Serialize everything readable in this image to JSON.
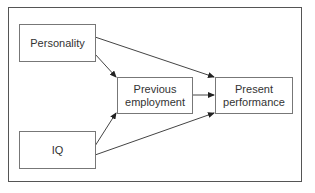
{
  "diagram": {
    "type": "path-diagram",
    "nodes": [
      {
        "id": "personality",
        "label": "Personality"
      },
      {
        "id": "iq",
        "label": "IQ"
      },
      {
        "id": "previous",
        "label": "Previous employment",
        "lines": [
          "Previous",
          "employment"
        ]
      },
      {
        "id": "present",
        "label": "Present performance",
        "lines": [
          "Present",
          "performance"
        ]
      }
    ],
    "edges": [
      {
        "from": "personality",
        "to": "present"
      },
      {
        "from": "personality",
        "to": "previous"
      },
      {
        "from": "iq",
        "to": "previous"
      },
      {
        "from": "iq",
        "to": "present"
      },
      {
        "from": "previous",
        "to": "present"
      }
    ],
    "colors": {
      "line": "#333333",
      "box_border": "#777777",
      "frame": "#555555",
      "text": "#333333"
    }
  }
}
